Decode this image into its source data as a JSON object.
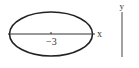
{
  "diagram": {
    "ellipse": {
      "cx": 51,
      "cy": 34,
      "rx": 41.5,
      "ry": 22,
      "stroke": "#222222"
    },
    "x_axis": {
      "x1": 8,
      "x2": 95,
      "y": 34,
      "label": "x"
    },
    "center_tick_label": "−3",
    "y_axis": {
      "x": 122,
      "y1": 12,
      "y2": 57,
      "label": "y"
    }
  }
}
